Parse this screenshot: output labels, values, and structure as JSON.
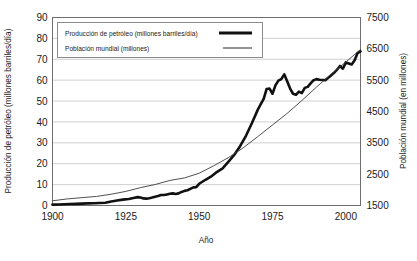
{
  "chart_data": {
    "type": "line",
    "title": "",
    "xlabel": "Año",
    "ylabel": "Producción de petróleo (millones barriles/día)",
    "y2label": "Población mundial (en millones)",
    "xlim": [
      1900,
      2005
    ],
    "ylim": [
      0,
      90
    ],
    "y2lim": [
      1500,
      7500
    ],
    "xticks": [
      "1900",
      "1925",
      "1950",
      "1975",
      "2000"
    ],
    "xtick_values": [
      1900,
      1925,
      1950,
      1975,
      2000
    ],
    "yticks": [
      "0",
      "10",
      "20",
      "30",
      "40",
      "50",
      "60",
      "70",
      "80",
      "90"
    ],
    "ytick_values": [
      0,
      10,
      20,
      30,
      40,
      50,
      60,
      70,
      80,
      90
    ],
    "y2ticks": [
      "1500",
      "2500",
      "3500",
      "4500",
      "5500",
      "6500",
      "7500"
    ],
    "y2tick_values": [
      1500,
      2500,
      3500,
      4500,
      5500,
      6500,
      7500
    ],
    "grid": true,
    "legend_position": "top-left-inside",
    "series": [
      {
        "name": "Producción de petróleo (millones barriles/día)",
        "axis": "left",
        "color": "#111111",
        "width": 2.6,
        "x": [
          1900,
          1902,
          1904,
          1906,
          1908,
          1910,
          1912,
          1914,
          1916,
          1918,
          1920,
          1922,
          1924,
          1926,
          1928,
          1929,
          1930,
          1931,
          1932,
          1933,
          1934,
          1935,
          1936,
          1937,
          1938,
          1939,
          1940,
          1941,
          1942,
          1943,
          1944,
          1945,
          1946,
          1947,
          1948,
          1949,
          1950,
          1952,
          1954,
          1956,
          1958,
          1960,
          1962,
          1964,
          1966,
          1968,
          1970,
          1971,
          1972,
          1973,
          1974,
          1975,
          1976,
          1977,
          1978,
          1979,
          1980,
          1981,
          1982,
          1983,
          1984,
          1985,
          1986,
          1987,
          1988,
          1989,
          1990,
          1991,
          1992,
          1993,
          1994,
          1995,
          1996,
          1997,
          1998,
          1999,
          2000,
          2001,
          2002,
          2003,
          2004,
          2005
        ],
        "y": [
          0.4,
          0.5,
          0.6,
          0.7,
          0.8,
          0.9,
          1.0,
          1.1,
          1.2,
          1.3,
          1.9,
          2.4,
          2.8,
          3.1,
          3.7,
          4.0,
          3.8,
          3.4,
          3.3,
          3.5,
          3.8,
          4.2,
          4.5,
          5.0,
          5.0,
          5.3,
          5.6,
          5.8,
          5.5,
          5.8,
          6.5,
          7.0,
          7.3,
          8.0,
          8.7,
          8.8,
          10.4,
          12.2,
          13.8,
          16.0,
          17.8,
          21.0,
          24.3,
          28.5,
          33.5,
          39.5,
          45.9,
          48.5,
          51.0,
          55.8,
          56.0,
          53.5,
          57.5,
          59.8,
          60.5,
          62.8,
          59.5,
          56.0,
          53.5,
          53.0,
          54.5,
          53.8,
          56.3,
          56.8,
          58.5,
          60.0,
          60.5,
          60.2,
          60.1,
          60.0,
          61.2,
          62.3,
          63.5,
          65.0,
          66.8,
          65.5,
          68.5,
          68.0,
          67.5,
          69.5,
          73.0,
          73.8
        ]
      },
      {
        "name": "Población mundial (millones)",
        "axis": "right",
        "color": "#3c3c3c",
        "width": 0.9,
        "x": [
          1900,
          1905,
          1910,
          1915,
          1920,
          1925,
          1930,
          1935,
          1940,
          1945,
          1950,
          1955,
          1960,
          1965,
          1970,
          1975,
          1980,
          1985,
          1990,
          1995,
          2000,
          2005
        ],
        "y": [
          1650,
          1710,
          1750,
          1790,
          1860,
          1950,
          2070,
          2170,
          2300,
          2380,
          2530,
          2770,
          3030,
          3340,
          3700,
          4070,
          4440,
          4850,
          5280,
          5690,
          6080,
          6480
        ]
      }
    ],
    "legend": [
      {
        "label": "Producción de petróleo (millones barriles/día)",
        "style": "thick-black-line"
      },
      {
        "label": "Población mundial (millones)",
        "style": "thin-gray-line"
      }
    ],
    "colors": {
      "oil_line": "#111111",
      "population_line": "#3c3c3c",
      "grid": "#cfcfcf",
      "frame": "#6e6e6e",
      "text": "#1a1a1a",
      "background": "#ffffff"
    }
  }
}
